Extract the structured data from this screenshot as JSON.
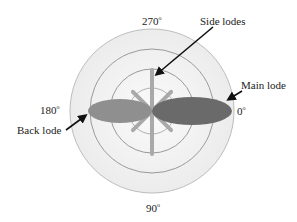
{
  "diagram": {
    "type": "antenna-radiation-pattern",
    "angle_labels": {
      "top": {
        "value": "270",
        "unit": "o"
      },
      "left": {
        "value": "180",
        "unit": "o"
      },
      "right": {
        "value": "0",
        "unit": "o"
      },
      "bottom": {
        "value": "90",
        "unit": "o"
      }
    },
    "annotations": {
      "side_lobes": "Side lodes",
      "main_lobe": "Main lode",
      "back_lobe": "Back lode"
    },
    "colors": {
      "main_lobe": "#6a6a6a",
      "back_lobe": "#8f8f8f",
      "side_lobes": "#a8a8a8",
      "rings": "#b9b9b9",
      "disc_fill": "#f1f1f1",
      "arrows": "#111111"
    },
    "ring_count": 4
  }
}
